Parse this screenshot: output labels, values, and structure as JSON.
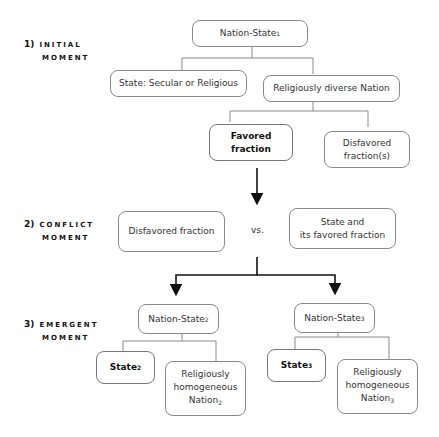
{
  "stages": [
    {
      "number": "1)",
      "line1": "INITIAL",
      "line2": "MOMENT"
    },
    {
      "number": "2)",
      "line1": "CONFLICT",
      "line2": "MOMENT"
    },
    {
      "number": "3)",
      "line1": "EMERGENT",
      "line2": "MOMENT"
    }
  ],
  "initial": {
    "root": {
      "text": "Nation-State",
      "sub": "1"
    },
    "state": "State: Secular or Religious",
    "nation": "Religiously diverse Nation",
    "favored_l1": "Favored",
    "favored_l2": "fraction",
    "disfavored_l1": "Disfavored",
    "disfavored_l2": "fraction(s)"
  },
  "conflict": {
    "left": "Disfavored fraction",
    "vs": "vs.",
    "right_l1": "State and",
    "right_l2": "its favored fraction"
  },
  "emergent": [
    {
      "root": "Nation-State",
      "root_sub": "2",
      "state": "State",
      "state_sub": "2",
      "nation_l1": "Religiously",
      "nation_l2": "homogeneous",
      "nation_l3": "Nation",
      "nation_sub": "2"
    },
    {
      "root": "Nation-State",
      "root_sub": "3",
      "state": "State",
      "state_sub": "3",
      "nation_l1": "Religiously",
      "nation_l2": "homogeneous",
      "nation_l3": "Nation",
      "nation_sub": "3"
    }
  ]
}
